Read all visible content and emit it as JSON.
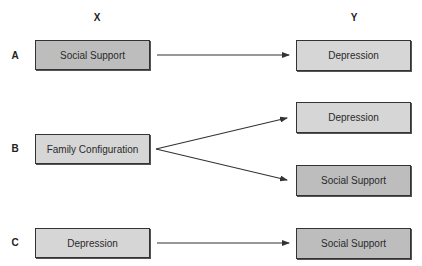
{
  "columns": {
    "x_label": "X",
    "y_label": "Y"
  },
  "rows": [
    {
      "label": "A",
      "x_box": {
        "text": "Social Support",
        "shade": "dark"
      },
      "y_boxes": [
        {
          "text": "Depression",
          "shade": "light"
        }
      ]
    },
    {
      "label": "B",
      "x_box": {
        "text": "Family Configuration",
        "shade": "light"
      },
      "y_boxes": [
        {
          "text": "Depression",
          "shade": "light"
        },
        {
          "text": "Social Support",
          "shade": "dark"
        }
      ]
    },
    {
      "label": "C",
      "x_box": {
        "text": "Depression",
        "shade": "light"
      },
      "y_boxes": [
        {
          "text": "Social Support",
          "shade": "dark"
        }
      ]
    }
  ],
  "colors": {
    "dark_fill": "#bdbdbd",
    "light_fill": "#d6d6d6",
    "border": "#333333",
    "arrow": "#333333"
  }
}
